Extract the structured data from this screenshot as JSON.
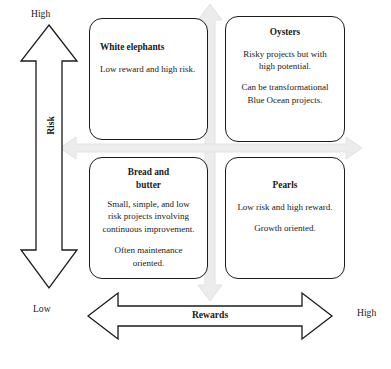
{
  "diagram": {
    "type": "2x2-matrix",
    "colors": {
      "outline": "#1b1b1b",
      "background": "#ffffff",
      "cross_arrow": "#e8e8e8",
      "cross_arrow_edge": "#d9d9d9",
      "text": "#1a1a1a"
    },
    "axes": {
      "vertical": {
        "name": "Risk",
        "high_label": "High",
        "low_label": "Low",
        "arrow": "double-headed-vertical"
      },
      "horizontal": {
        "name": "Rewards",
        "low_label": "Low",
        "high_label": "High",
        "arrow": "double-headed-horizontal"
      }
    },
    "quadrants": [
      {
        "id": "white-elephants",
        "position": "top-left",
        "risk": "high",
        "reward": "low",
        "title": "White elephants",
        "align": "left",
        "paragraphs": [
          "Low reward and high risk."
        ]
      },
      {
        "id": "oysters",
        "position": "top-right",
        "risk": "high",
        "reward": "high",
        "title": "Oysters",
        "align": "center",
        "paragraphs": [
          "Risky projects but with high potential.",
          "Can be transformational Blue Ocean projects."
        ]
      },
      {
        "id": "bread-and-butter",
        "position": "bottom-left",
        "risk": "low",
        "reward": "low",
        "title": "Bread and butter",
        "align": "center",
        "paragraphs": [
          "Small, simple, and low risk projects involving continuous improvement.",
          "Often maintenance oriented."
        ]
      },
      {
        "id": "pearls",
        "position": "bottom-right",
        "risk": "low",
        "reward": "high",
        "title": "Pearls",
        "align": "center",
        "paragraphs": [
          "Low risk and high reward.",
          "Growth oriented."
        ]
      }
    ]
  }
}
